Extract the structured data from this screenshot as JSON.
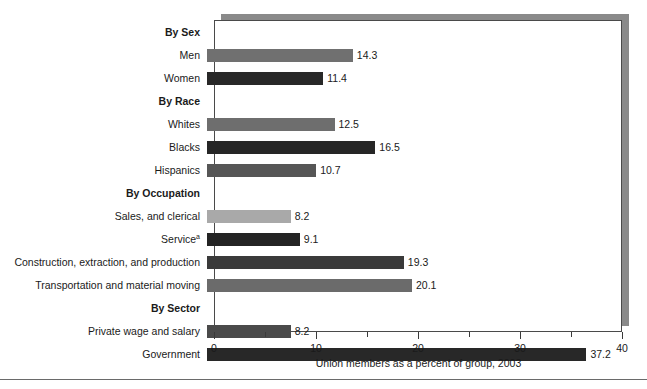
{
  "chart_data": {
    "type": "bar",
    "orientation": "horizontal",
    "title": "",
    "xlabel": "Union members as a percent of group, 2003",
    "ylabel": "",
    "xlim": [
      0,
      40
    ],
    "xticks": [
      0,
      10,
      20,
      30,
      40
    ],
    "xtick_labels": [
      "0",
      "10",
      "20",
      "30",
      "40"
    ],
    "minor_tick_interval": 5,
    "grid": false,
    "legend": "none",
    "rows": [
      {
        "label": "By Sex",
        "is_group": true,
        "value": null,
        "value_label": "",
        "color": ""
      },
      {
        "label": "Men",
        "is_group": false,
        "value": 14.3,
        "value_label": "14.3",
        "color": "#707070"
      },
      {
        "label": "Women",
        "is_group": false,
        "value": 11.4,
        "value_label": "11.4",
        "color": "#282828"
      },
      {
        "label": "By Race",
        "is_group": true,
        "value": null,
        "value_label": "",
        "color": ""
      },
      {
        "label": "Whites",
        "is_group": false,
        "value": 12.5,
        "value_label": "12.5",
        "color": "#6e6e6e"
      },
      {
        "label": "Blacks",
        "is_group": false,
        "value": 16.5,
        "value_label": "16.5",
        "color": "#262626"
      },
      {
        "label": "Hispanics",
        "is_group": false,
        "value": 10.7,
        "value_label": "10.7",
        "color": "#565656"
      },
      {
        "label": "By Occupation",
        "is_group": true,
        "value": null,
        "value_label": "",
        "color": ""
      },
      {
        "label": "Sales, and clerical",
        "is_group": false,
        "value": 8.2,
        "value_label": "8.2",
        "color": "#a9a9a9"
      },
      {
        "label": "Service",
        "is_group": false,
        "value": 9.1,
        "value_label": "9.1",
        "color": "#242424",
        "superscript": "a"
      },
      {
        "label": "Construction, extraction, and production",
        "is_group": false,
        "value": 19.3,
        "value_label": "19.3",
        "color": "#3a3a3a"
      },
      {
        "label": "Transportation and material moving",
        "is_group": false,
        "value": 20.1,
        "value_label": "20.1",
        "color": "#6b6b6b"
      },
      {
        "label": "By Sector",
        "is_group": true,
        "value": null,
        "value_label": "",
        "color": ""
      },
      {
        "label": "Private wage and salary",
        "is_group": false,
        "value": 8.2,
        "value_label": "8.2",
        "color": "#4a4a4a"
      },
      {
        "label": "Government",
        "is_group": false,
        "value": 37.2,
        "value_label": "37.2",
        "color": "#282828"
      }
    ]
  }
}
